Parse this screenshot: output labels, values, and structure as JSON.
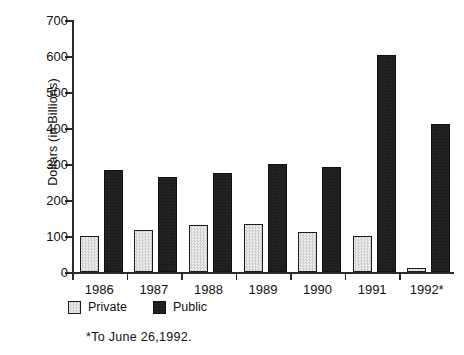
{
  "chart_data": {
    "type": "bar",
    "title": "",
    "subtitle": "",
    "xlabel": "",
    "ylabel": "Dollars  (in  Billions)",
    "categories": [
      "1986",
      "1987",
      "1988",
      "1989",
      "1990",
      "1991",
      "1992*"
    ],
    "series": [
      {
        "name": "Private",
        "values": [
          100,
          117,
          131,
          133,
          111,
          100,
          10
        ]
      },
      {
        "name": "Public",
        "values": [
          283,
          265,
          275,
          300,
          291,
          603,
          412
        ]
      }
    ],
    "ylim": [
      0,
      700
    ],
    "yticks": [
      0,
      100,
      200,
      300,
      400,
      500,
      600,
      700
    ],
    "ytick_labels": [
      "0",
      "100",
      "200",
      "300",
      "400",
      "500",
      "600",
      "700"
    ],
    "grid": false,
    "legend_position": "below-axis-left",
    "annotations": [
      "*To  June  26,1992."
    ]
  },
  "legend": {
    "items": [
      {
        "label": "Private",
        "color": "#d9d9d9",
        "pattern": "stipple"
      },
      {
        "label": "Public",
        "color": "#1c1c1c",
        "pattern": "solid"
      }
    ]
  },
  "footnote": {
    "text": "*To  June  26,1992."
  },
  "colors": {
    "private": "#d9d9d9",
    "public": "#1c1c1c",
    "axis": "#2b2b2b",
    "background": "#ffffff",
    "text": "#111111"
  }
}
